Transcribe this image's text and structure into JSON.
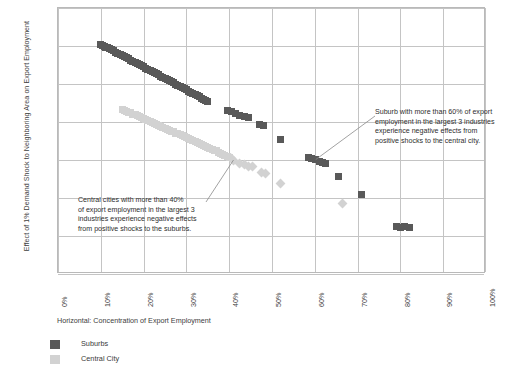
{
  "chart_data": {
    "type": "scatter",
    "title": "",
    "xlabel": "Horizontal: Concentration of Export Employment",
    "ylabel": "Effect of 1% Demand Shock to Neighboring Area on Export Employment",
    "xlim": [
      0,
      100
    ],
    "ylim": [
      -60,
      80
    ],
    "xticks": [
      "0%",
      "10%",
      "20%",
      "30%",
      "40%",
      "50%",
      "60%",
      "70%",
      "80%",
      "90%",
      "100%"
    ],
    "yticks": [
      "80%",
      "60%",
      "40%",
      "20%",
      "0%",
      "-20%",
      "-40%",
      "-60%"
    ],
    "grid": true,
    "legend_position": "bottom-left",
    "colors": {
      "suburbs": "#595959",
      "central_city": "#d2d2d2",
      "grid": "#c4c4c4",
      "axis": "#b9b9b9"
    },
    "series": [
      {
        "name": "Suburbs",
        "marker": "square",
        "color": "#595959",
        "points": [
          [
            10.0,
            60.8
          ],
          [
            10.4,
            60.4
          ],
          [
            10.8,
            60.0
          ],
          [
            11.2,
            59.4
          ],
          [
            11.6,
            59.0
          ],
          [
            12.0,
            58.6
          ],
          [
            12.5,
            58.0
          ],
          [
            13.0,
            57.4
          ],
          [
            13.5,
            56.8
          ],
          [
            14.0,
            56.2
          ],
          [
            14.5,
            55.6
          ],
          [
            15.0,
            55.0
          ],
          [
            15.5,
            54.4
          ],
          [
            16.0,
            53.8
          ],
          [
            16.5,
            53.2
          ],
          [
            17.0,
            52.6
          ],
          [
            17.5,
            52.0
          ],
          [
            18.0,
            51.4
          ],
          [
            18.5,
            50.8
          ],
          [
            19.0,
            50.2
          ],
          [
            19.5,
            49.6
          ],
          [
            20.0,
            49.0
          ],
          [
            20.5,
            48.4
          ],
          [
            21.0,
            47.8
          ],
          [
            21.5,
            47.2
          ],
          [
            22.0,
            46.6
          ],
          [
            22.5,
            46.0
          ],
          [
            23.0,
            45.4
          ],
          [
            23.5,
            44.8
          ],
          [
            24.0,
            44.2
          ],
          [
            24.5,
            43.6
          ],
          [
            25.0,
            43.0
          ],
          [
            25.5,
            42.4
          ],
          [
            26.0,
            41.8
          ],
          [
            26.5,
            41.2
          ],
          [
            27.0,
            40.6
          ],
          [
            27.5,
            40.0
          ],
          [
            28.0,
            39.4
          ],
          [
            28.5,
            38.8
          ],
          [
            29.0,
            38.2
          ],
          [
            29.5,
            37.6
          ],
          [
            30.0,
            37.0
          ],
          [
            30.5,
            36.2
          ],
          [
            31.0,
            35.6
          ],
          [
            31.5,
            35.0
          ],
          [
            32.0,
            34.4
          ],
          [
            32.5,
            33.8
          ],
          [
            33.0,
            33.2
          ],
          [
            33.5,
            32.6
          ],
          [
            34.0,
            32.0
          ],
          [
            34.5,
            31.4
          ],
          [
            35.0,
            30.8
          ],
          [
            39.5,
            26.0
          ],
          [
            40.5,
            25.4
          ],
          [
            41.5,
            24.6
          ],
          [
            42.5,
            23.6
          ],
          [
            43.5,
            22.8
          ],
          [
            44.5,
            22.2
          ],
          [
            47.0,
            18.6
          ],
          [
            48.0,
            18.0
          ],
          [
            52.0,
            11.0
          ],
          [
            58.5,
            1.6
          ],
          [
            59.3,
            1.0
          ],
          [
            60.2,
            0.2
          ],
          [
            61.0,
            -0.6
          ],
          [
            61.8,
            -1.4
          ],
          [
            62.6,
            -2.0
          ],
          [
            65.5,
            -8.6
          ],
          [
            71.0,
            -18.2
          ],
          [
            79.0,
            -34.8
          ],
          [
            80.0,
            -35.4
          ],
          [
            81.0,
            -35.0
          ],
          [
            82.0,
            -35.6
          ]
        ]
      },
      {
        "name": "Central City",
        "marker": "square-to-diamond",
        "color": "#d2d2d2",
        "points": [
          [
            15.0,
            26.8
          ],
          [
            15.5,
            26.2
          ],
          [
            16.0,
            25.8
          ],
          [
            16.5,
            25.2
          ],
          [
            17.0,
            24.8
          ],
          [
            17.5,
            24.2
          ],
          [
            18.0,
            23.8
          ],
          [
            18.5,
            23.2
          ],
          [
            19.0,
            22.8
          ],
          [
            19.5,
            22.2
          ],
          [
            20.0,
            21.8
          ],
          [
            20.5,
            21.2
          ],
          [
            21.0,
            20.8
          ],
          [
            21.5,
            20.2
          ],
          [
            22.0,
            19.8
          ],
          [
            22.5,
            19.2
          ],
          [
            23.0,
            18.8
          ],
          [
            23.5,
            18.2
          ],
          [
            24.0,
            17.8
          ],
          [
            24.5,
            17.2
          ],
          [
            25.0,
            16.8
          ],
          [
            25.5,
            16.2
          ],
          [
            26.0,
            15.8
          ],
          [
            26.5,
            15.2
          ],
          [
            27.0,
            14.8
          ],
          [
            27.5,
            14.2
          ],
          [
            28.0,
            13.8
          ],
          [
            28.5,
            13.2
          ],
          [
            29.0,
            12.8
          ],
          [
            29.5,
            12.2
          ],
          [
            30.0,
            11.8
          ],
          [
            30.5,
            11.2
          ],
          [
            31.0,
            10.8
          ],
          [
            31.5,
            10.2
          ],
          [
            32.0,
            9.8
          ],
          [
            32.5,
            9.2
          ],
          [
            33.0,
            8.8
          ],
          [
            33.5,
            8.2
          ],
          [
            34.0,
            7.8
          ],
          [
            34.5,
            7.2
          ],
          [
            35.0,
            6.8
          ],
          [
            35.5,
            6.2
          ],
          [
            36.0,
            5.8
          ],
          [
            36.5,
            5.2
          ],
          [
            37.0,
            4.8
          ],
          [
            37.5,
            4.2
          ],
          [
            38.0,
            3.6
          ],
          [
            38.5,
            3.0
          ],
          [
            39.0,
            2.4
          ],
          [
            39.5,
            1.8
          ],
          [
            40.0,
            1.2
          ],
          [
            40.5,
            0.6
          ],
          [
            41.0,
            0.0
          ],
          [
            42.5,
            -2.0
          ],
          [
            43.5,
            -2.6
          ],
          [
            44.5,
            -3.2
          ],
          [
            45.5,
            -3.6
          ],
          [
            47.5,
            -6.6
          ],
          [
            48.5,
            -7.2
          ],
          [
            52.0,
            -12.6
          ],
          [
            66.5,
            -23.0
          ]
        ]
      }
    ],
    "annotations": [
      {
        "id": "central-city-note",
        "lines": [
          "Central cities with more than 40%",
          "of export employment in the largest 3",
          "industries experience negative effects",
          "from positive shocks to the suburbs."
        ],
        "target": [
          41.0,
          0.0
        ]
      },
      {
        "id": "suburb-note",
        "lines": [
          "Suburb with more than 60% of export",
          "employment in the largest 3 industries",
          "experience negative effects from",
          "positive shocks to the central city."
        ],
        "target": [
          60.2,
          0.2
        ]
      }
    ]
  },
  "legend": {
    "items": [
      {
        "label": "Suburbs",
        "color": "#595959"
      },
      {
        "label": "Central City",
        "color": "#d2d2d2"
      }
    ]
  }
}
